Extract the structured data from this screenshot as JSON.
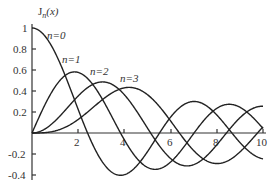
{
  "chart_data": {
    "type": "line",
    "title": "",
    "ylabel": "J_n(x)",
    "xlabel": "",
    "xlim": [
      0,
      10
    ],
    "ylim": [
      -0.4,
      1
    ],
    "grid": false,
    "x_ticks": [
      "2",
      "4",
      "6",
      "8",
      "10"
    ],
    "y_ticks": [
      "1",
      "0.8",
      "0.6",
      "0.4",
      "0.2",
      "-0.2",
      "-0.4"
    ],
    "series": [
      {
        "name": "n=0",
        "label": "n=0",
        "function": "J0(x)"
      },
      {
        "name": "n=1",
        "label": "n=1",
        "function": "J1(x)"
      },
      {
        "name": "n=2",
        "label": "n=2",
        "function": "J2(x)"
      },
      {
        "name": "n=3",
        "label": "n=3",
        "function": "J3(x)"
      }
    ],
    "annotations": [
      "n=0",
      "n=1",
      "n=2",
      "n=3"
    ]
  },
  "labels": {
    "ylabel_main": "J",
    "ylabel_sub": "n",
    "ylabel_arg": "(x)",
    "n0": "n=0",
    "n1": "n=1",
    "n2": "n=2",
    "n3": "n=3",
    "t1": "1",
    "t08": "0.8",
    "t06": "0.6",
    "t04": "0.4",
    "t02": "0.2",
    "tm02": "-0.2",
    "tm04": "-0.4",
    "x2": "2",
    "x4": "4",
    "x6": "6",
    "x8": "8",
    "x10": "10"
  }
}
